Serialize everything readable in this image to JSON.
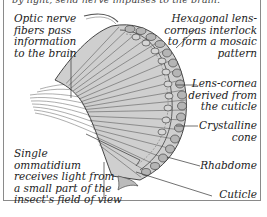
{
  "figure": {
    "caption_fragment": "by light, send nerve impulses to the brain.",
    "labels": {
      "optic_nerve": [
        "Optic nerve",
        "fibers pass",
        "information",
        "to the brain"
      ],
      "hexagonal": [
        "Hexagonal lens-",
        "corneas interlock",
        "to form a mosaic",
        "pattern"
      ],
      "lens_cornea": [
        "Lens-cornea",
        "derived from",
        "the cuticle"
      ],
      "crystalline_cone": [
        "Crystalline",
        "cone"
      ],
      "ommatidium": [
        "Single",
        "ommatidium",
        "receives light from",
        "a small part of the",
        "insect's field of view"
      ],
      "rhabdome": [
        "Rhabdome"
      ],
      "cuticle": [
        "Cuticle"
      ]
    },
    "colors": {
      "border": "#8a8a8a",
      "ink": "#222222",
      "shade": "#9a9a9a"
    }
  }
}
